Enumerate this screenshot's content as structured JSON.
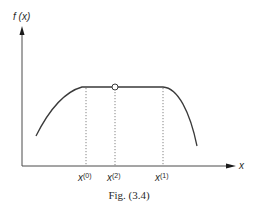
{
  "figure": {
    "caption": "Fig. (3.4)",
    "y_axis_label": "f (x)",
    "x_axis_label": "x",
    "x_markers": [
      {
        "base": "x",
        "sup": "(0)"
      },
      {
        "base": "x",
        "sup": "(2)"
      },
      {
        "base": "x",
        "sup": "(1)"
      }
    ],
    "colors": {
      "line": "#3a3a3a",
      "axis": "#4a4a4a",
      "dotted": "#777777",
      "background": "#ffffff"
    }
  }
}
